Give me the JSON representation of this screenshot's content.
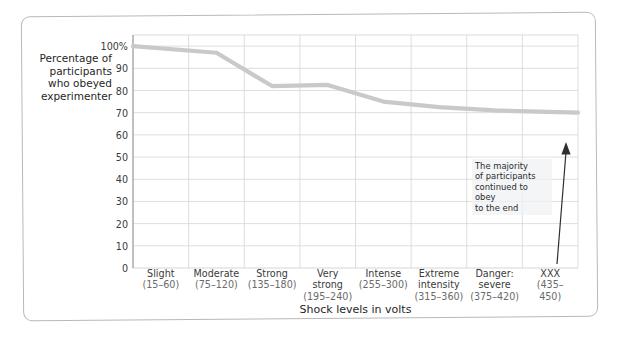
{
  "chart_data": {
    "type": "line",
    "title": "",
    "xlabel": "Shock levels in volts",
    "ylabel": "Percentage of participants who obeyed experimenter",
    "categories": [
      "Slight (15–60)",
      "Moderate (75–120)",
      "Strong (135–180)",
      "Very strong (195–240)",
      "Intense (255–300)",
      "Extreme intensity (315–360)",
      "Danger: severe (375–420)",
      "XXX (435–450)"
    ],
    "values": [
      100,
      97,
      82,
      82.5,
      75,
      72.5,
      71,
      70
    ],
    "ylim": [
      0,
      105
    ],
    "yticks": [
      0,
      10,
      20,
      30,
      40,
      50,
      60,
      70,
      80,
      90,
      100
    ],
    "ytick_labels": [
      "0",
      "10",
      "20",
      "30",
      "40",
      "50",
      "60",
      "70",
      "80",
      "90",
      "100%"
    ],
    "grid": true,
    "legend": "none",
    "line_color": "#c9c9c9",
    "grid_color": "#d6d6d6",
    "annotations": [
      {
        "text": "The majority\nof participants\ncontinued to obey\nto the end",
        "arrow": "up"
      }
    ]
  },
  "axes": {
    "y_title_lines": [
      "Percentage of",
      "participants",
      "who obeyed",
      "experimenter"
    ],
    "x_title": "Shock levels in volts"
  },
  "x_labels": [
    {
      "name": "Slight",
      "range": "(15–60)"
    },
    {
      "name": "Moderate",
      "range": "(75–120)"
    },
    {
      "name": "Strong",
      "range": "(135–180)"
    },
    {
      "name": "Very\nstrong",
      "range": "(195–240)"
    },
    {
      "name": "Intense",
      "range": "(255–300)"
    },
    {
      "name": "Extreme\nintensity",
      "range": "(315–360)"
    },
    {
      "name": "Danger:\nsevere",
      "range": "(375–420)"
    },
    {
      "name": "XXX",
      "range": "(435–450)"
    }
  ],
  "annotation": {
    "line1": "The majority",
    "line2": "of participants",
    "line3": "continued to obey",
    "line4": "to the end"
  }
}
